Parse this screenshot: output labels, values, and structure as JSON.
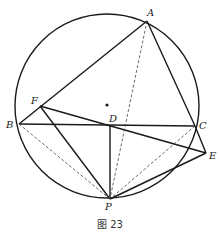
{
  "figure": {
    "caption": "图 23",
    "circle": {
      "cx": 107,
      "cy": 106,
      "r": 92
    },
    "center_dot": {
      "x": 107,
      "y": 105
    },
    "points": {
      "A": {
        "label": "A",
        "x": 147,
        "y": 21,
        "lx": 147,
        "ly": 16
      },
      "B": {
        "label": "B",
        "x": 19,
        "y": 124,
        "lx": 6,
        "ly": 128
      },
      "C": {
        "label": "C",
        "x": 195,
        "y": 126,
        "lx": 199,
        "ly": 129
      },
      "D": {
        "label": "D",
        "x": 110,
        "y": 126,
        "lx": 109,
        "ly": 122
      },
      "E": {
        "label": "E",
        "x": 206,
        "y": 153,
        "lx": 209,
        "ly": 159
      },
      "F": {
        "label": "F",
        "x": 40,
        "y": 106,
        "lx": 31,
        "ly": 104
      },
      "P": {
        "label": "P",
        "x": 110,
        "y": 199,
        "lx": 105,
        "ly": 210
      }
    },
    "solid_segments": [
      "AB",
      "AC",
      "BC",
      "FE",
      "FP",
      "DP",
      "PE",
      "CE"
    ],
    "dashed_segments": [
      "AP",
      "BP",
      "CP"
    ]
  }
}
